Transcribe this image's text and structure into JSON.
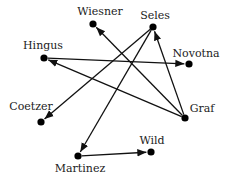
{
  "diagram": {
    "type": "directed-graph",
    "colors": {
      "node": "#000000",
      "edge": "#111111",
      "label": "#222222",
      "background": "#ffffff"
    },
    "nodes": [
      {
        "id": "wiesner",
        "label": "Wiesner"
      },
      {
        "id": "seles",
        "label": "Seles"
      },
      {
        "id": "hingus",
        "label": "Hingus"
      },
      {
        "id": "novotna",
        "label": "Novotna"
      },
      {
        "id": "coetzer",
        "label": "Coetzer"
      },
      {
        "id": "graf",
        "label": "Graf"
      },
      {
        "id": "martinez",
        "label": "Martinez"
      },
      {
        "id": "wild",
        "label": "Wild"
      }
    ],
    "edges": [
      {
        "from": "hingus",
        "to": "novotna"
      },
      {
        "from": "graf",
        "to": "hingus"
      },
      {
        "from": "graf",
        "to": "wiesner"
      },
      {
        "from": "graf",
        "to": "seles"
      },
      {
        "from": "seles",
        "to": "coetzer"
      },
      {
        "from": "seles",
        "to": "martinez"
      },
      {
        "from": "martinez",
        "to": "wild"
      }
    ]
  }
}
